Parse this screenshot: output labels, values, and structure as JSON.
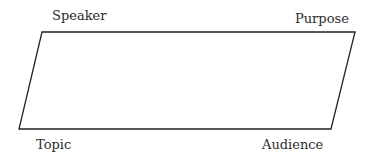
{
  "diagram": {
    "type": "parallelogram",
    "stroke_color": "#222222",
    "fill_color": "#ffffff",
    "vertices": {
      "top_left": [
        42,
        32
      ],
      "top_right": [
        355,
        32
      ],
      "bottom_right": [
        331,
        129
      ],
      "bottom_left": [
        19,
        129
      ]
    },
    "labels": {
      "top_left": "Speaker",
      "top_right": "Purpose",
      "bottom_left": "Topic",
      "bottom_right": "Audience"
    }
  }
}
